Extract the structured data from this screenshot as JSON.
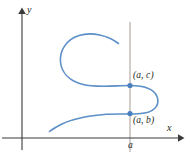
{
  "figure": {
    "kind": "coordinate-plane-curve",
    "background_color": "#ffffff"
  },
  "axes": {
    "x_label": "x",
    "y_label": "y",
    "color": "#3b3b3b",
    "origin": {
      "x": 22,
      "y": 138
    },
    "x_axis": {
      "start_x": 2,
      "end_x": 182,
      "y": 138
    },
    "y_axis": {
      "x": 22,
      "start_y": 150,
      "end_y": 8
    }
  },
  "vertical_line": {
    "label": "a",
    "x": 130,
    "top_y": 22,
    "bottom_y": 152,
    "color": "#9b8e8a"
  },
  "curve": {
    "color": "#5b8fc7",
    "stroke_width": 1.6,
    "path": "M 118.5 43.5 C 108 35.5 92 31.5 79 35.5 C 66 39.5 59.5 51 60.5 62 C 61.5 73 70 81 83 84.5 C 96 88 116 85.5 130 85.5 C 144 85.5 154 89 157 96.5 C 160 104 155.5 110.5 146 112.8 C 136 115.2 118 113.2 104 114.5 C 88 116 72 119 62 124 C 56 127 52 129.5 49.5 131.5"
  },
  "points": [
    {
      "id": "point-upper",
      "label": "(a, c)",
      "cx": 130,
      "cy": 85.5,
      "color": "#4a7fbf",
      "radius": 2.6
    },
    {
      "id": "point-lower",
      "label": "(a, b)",
      "cx": 130,
      "cy": 113.6,
      "color": "#4a7fbf",
      "radius": 2.6
    }
  ],
  "labels": {
    "point_upper": "(a, c)",
    "point_lower": "(a, b)",
    "tick_a": "a",
    "axis_x": "x",
    "axis_y": "y"
  }
}
